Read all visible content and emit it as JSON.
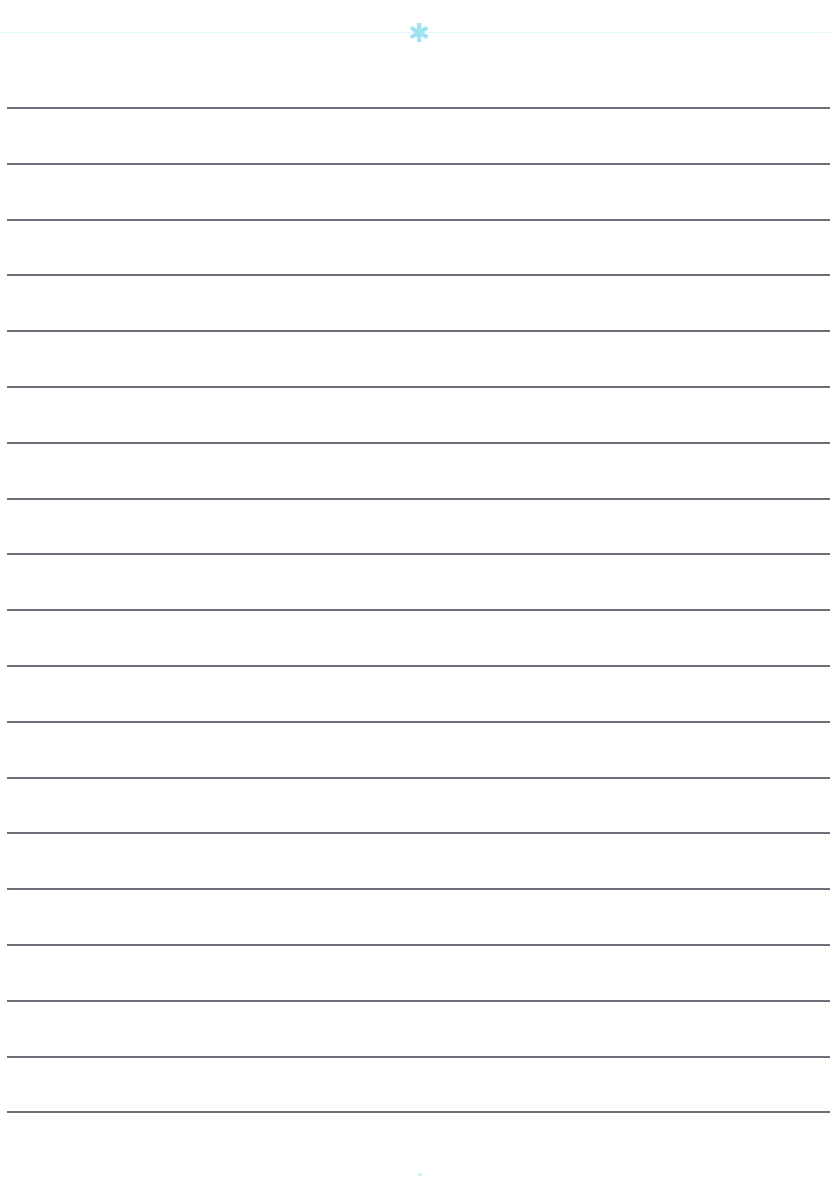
{
  "page": {
    "type": "lined-paper",
    "background_color": "#ffffff",
    "header": {
      "ornament_glyph": "✱",
      "ornament_color": "#9fe3f3",
      "rule_color": "#e3f6fb"
    },
    "lines": {
      "count": 19,
      "color": "#6a6f78",
      "first_y": 107,
      "spacing_px": 55.8
    },
    "footer": {
      "dot_color": "#cdeff8"
    }
  }
}
